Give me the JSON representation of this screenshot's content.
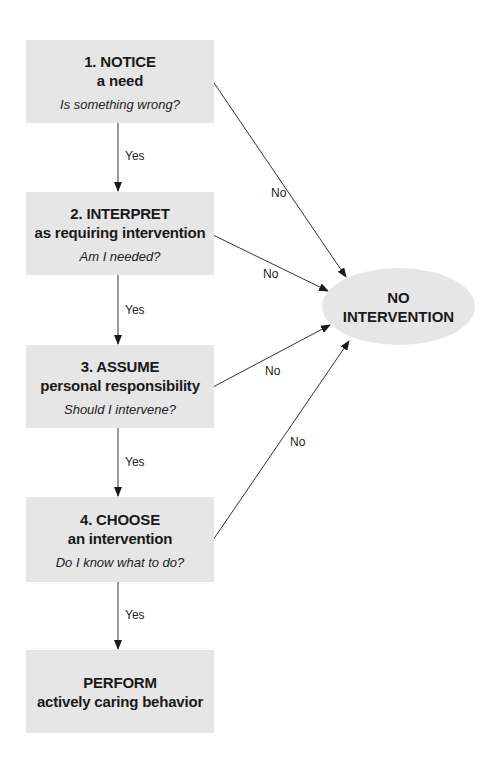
{
  "steps": [
    {
      "title_line1": "1. NOTICE",
      "title_line2": "a need",
      "question": "Is something wrong?"
    },
    {
      "title_line1": "2. INTERPRET",
      "title_line2": "as requiring intervention",
      "question": "Am I needed?"
    },
    {
      "title_line1": "3. ASSUME",
      "title_line2": "personal responsibility",
      "question": "Should I intervene?"
    },
    {
      "title_line1": "4. CHOOSE",
      "title_line2": "an intervention",
      "question": "Do I know what to do?"
    }
  ],
  "final": {
    "title_line1": "PERFORM",
    "title_line2": "actively caring behavior"
  },
  "no_intervention": {
    "line1": "NO",
    "line2": "INTERVENTION"
  },
  "labels": {
    "yes": "Yes",
    "no": "No"
  },
  "colors": {
    "box_fill": "#e6e6e6",
    "line": "#333333"
  }
}
